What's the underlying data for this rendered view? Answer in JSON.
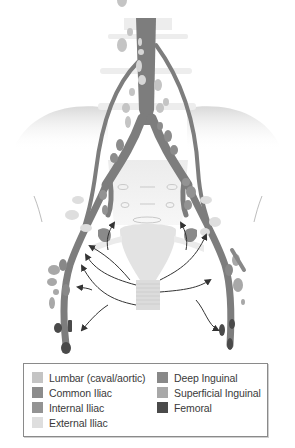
{
  "figure": {
    "colors": {
      "lumbar": "#c4c4c4",
      "common_iliac": "#8c8c8c",
      "internal_iliac": "#939393",
      "external_iliac": "#dedede",
      "deep_inguinal": "#888888",
      "superficial_inguinal": "#a8a8a8",
      "femoral": "#4a4a4a",
      "vessel": "#7d7d7d",
      "bone": "#e9e9e9",
      "uterus": "#e2e2e2",
      "arrow": "#333333"
    }
  },
  "legend": {
    "left": [
      {
        "label": "Lumbar (caval/aortic)",
        "color": "#c4c4c4"
      },
      {
        "label": "Common Iliac",
        "color": "#8c8c8c"
      },
      {
        "label": "Internal Iliac",
        "color": "#939393"
      },
      {
        "label": "External Iliac",
        "color": "#dedede"
      }
    ],
    "right": [
      {
        "label": "Deep Inguinal",
        "color": "#888888"
      },
      {
        "label": "Superficial Inguinal",
        "color": "#a8a8a8"
      },
      {
        "label": "Femoral",
        "color": "#4a4a4a"
      }
    ]
  }
}
